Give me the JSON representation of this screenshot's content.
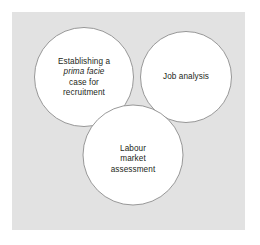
{
  "figure": {
    "type": "venn-diagram",
    "set_count": 3,
    "panel_color": "#e2e2e2",
    "circle_fill": "#ffffff",
    "circle_stroke": "#8c8c8c",
    "text_color": "#231f20"
  },
  "circles": [
    {
      "id": "establishing-prima-facie-case",
      "position": "top-left",
      "lines": [
        {
          "text": "Establishing a",
          "style": "normal"
        },
        {
          "text": "prima facie",
          "style": "italic"
        },
        {
          "text": "case for",
          "style": "normal"
        },
        {
          "text": "recruitment",
          "style": "normal"
        }
      ]
    },
    {
      "id": "job-analysis",
      "position": "top-right",
      "lines": [
        {
          "text": "Job analysis",
          "style": "normal"
        }
      ]
    },
    {
      "id": "labour-market-assessment",
      "position": "bottom-center",
      "lines": [
        {
          "text": "Labour",
          "style": "normal"
        },
        {
          "text": "market",
          "style": "normal"
        },
        {
          "text": "assessment",
          "style": "normal"
        }
      ]
    }
  ]
}
